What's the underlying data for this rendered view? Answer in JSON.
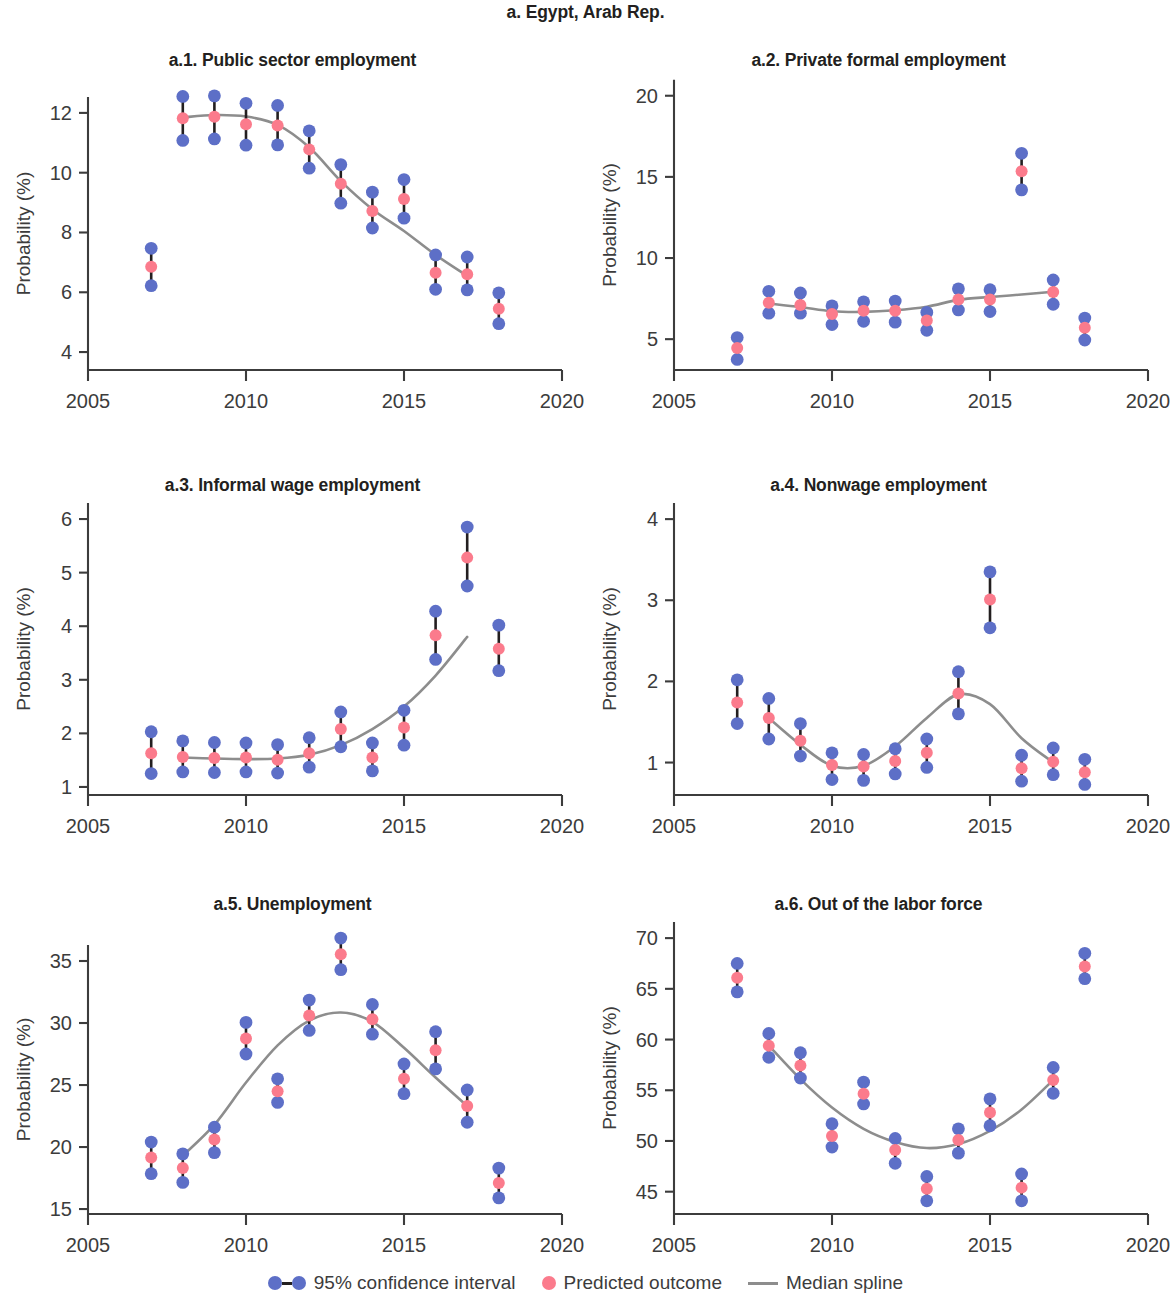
{
  "figure": {
    "title": "a. Egypt, Arab Rep.",
    "colors": {
      "ci_dot": "#5d6fc7",
      "predicted_dot": "#fb7b8c",
      "ci_bar": "#231f20",
      "spline": "#8d8d8d",
      "axis": "#3c3c3c",
      "background": "#ffffff"
    }
  },
  "legend": {
    "items": [
      {
        "label": "95% confidence interval",
        "marker": "ci-dot-bar-dot"
      },
      {
        "label": "Predicted outcome",
        "marker": "pink-dot"
      },
      {
        "label": "Median spline",
        "marker": "gray-line"
      }
    ]
  },
  "chart_data": [
    {
      "type": "scatter",
      "id": "a.1",
      "title": "a.1. Public sector employment",
      "xlabel": "",
      "ylabel": "Probability (%)",
      "xlim": [
        2005,
        2020
      ],
      "ylim": [
        3.4,
        12.9
      ],
      "xticks": [
        2005,
        2010,
        2015,
        2020
      ],
      "yticks": [
        4,
        6,
        8,
        10,
        12
      ],
      "grid": false,
      "x": [
        2007,
        2008,
        2009,
        2010,
        2011,
        2012,
        2013,
        2014,
        2015,
        2016,
        2017,
        2018
      ],
      "predicted": [
        6.85,
        11.82,
        11.87,
        11.62,
        11.58,
        10.78,
        9.63,
        8.72,
        9.12,
        6.65,
        6.6,
        5.45
      ],
      "ci_low": [
        6.22,
        11.08,
        11.13,
        10.92,
        10.93,
        10.15,
        8.98,
        8.15,
        8.48,
        6.1,
        6.08,
        4.95
      ],
      "ci_high": [
        7.47,
        12.55,
        12.57,
        12.32,
        12.25,
        11.4,
        10.27,
        9.35,
        9.77,
        7.25,
        7.18,
        5.98
      ],
      "spline": [
        [
          2008,
          11.85
        ],
        [
          2009,
          11.93
        ],
        [
          2010,
          11.88
        ],
        [
          2011,
          11.6
        ],
        [
          2012,
          10.85
        ],
        [
          2013,
          9.72
        ],
        [
          2014,
          8.78
        ],
        [
          2015,
          8.05
        ],
        [
          2016,
          7.25
        ],
        [
          2017,
          6.55
        ]
      ]
    },
    {
      "type": "scatter",
      "id": "a.2",
      "title": "a.2. Private formal employment",
      "xlabel": "",
      "ylabel": "Probability (%)",
      "xlim": [
        2005,
        2020
      ],
      "ylim": [
        3.1,
        20.6
      ],
      "xticks": [
        2005,
        2010,
        2015,
        2020
      ],
      "yticks": [
        5,
        10,
        15,
        20
      ],
      "grid": false,
      "x": [
        2007,
        2008,
        2009,
        2010,
        2011,
        2012,
        2013,
        2014,
        2015,
        2016,
        2017,
        2018
      ],
      "predicted": [
        4.45,
        7.25,
        7.1,
        6.55,
        6.75,
        6.75,
        6.15,
        7.45,
        7.45,
        15.35,
        7.9,
        5.7
      ],
      "ci_low": [
        3.75,
        6.6,
        6.6,
        5.9,
        6.1,
        6.05,
        5.55,
        6.8,
        6.7,
        14.2,
        7.15,
        4.95
      ],
      "ci_high": [
        5.1,
        7.95,
        7.85,
        7.05,
        7.3,
        7.35,
        6.65,
        8.1,
        8.05,
        16.45,
        8.65,
        6.3
      ],
      "spline": [
        [
          2008,
          7.2
        ],
        [
          2009,
          6.98
        ],
        [
          2010,
          6.72
        ],
        [
          2011,
          6.68
        ],
        [
          2012,
          6.78
        ],
        [
          2013,
          7.0
        ],
        [
          2014,
          7.42
        ],
        [
          2015,
          7.6
        ],
        [
          2016,
          7.75
        ],
        [
          2017,
          7.92
        ]
      ]
    },
    {
      "type": "scatter",
      "id": "a.3",
      "title": "a.3. Informal wage employment",
      "xlabel": "",
      "ylabel": "Probability (%)",
      "xlim": [
        2005,
        2020
      ],
      "ylim": [
        0.85,
        6.15
      ],
      "xticks": [
        2005,
        2010,
        2015,
        2020
      ],
      "yticks": [
        1,
        2,
        3,
        4,
        5,
        6
      ],
      "grid": false,
      "x": [
        2007,
        2008,
        2009,
        2010,
        2011,
        2012,
        2013,
        2014,
        2015,
        2016,
        2017,
        2018
      ],
      "predicted": [
        1.63,
        1.56,
        1.54,
        1.55,
        1.51,
        1.63,
        2.08,
        1.55,
        2.11,
        3.83,
        5.28,
        3.58
      ],
      "ci_low": [
        1.25,
        1.28,
        1.27,
        1.28,
        1.26,
        1.37,
        1.75,
        1.3,
        1.78,
        3.38,
        4.75,
        3.17
      ],
      "ci_high": [
        2.03,
        1.86,
        1.83,
        1.82,
        1.79,
        1.92,
        2.4,
        1.82,
        2.43,
        4.28,
        5.85,
        4.02
      ],
      "spline": [
        [
          2008,
          1.55
        ],
        [
          2009,
          1.53
        ],
        [
          2010,
          1.52
        ],
        [
          2011,
          1.53
        ],
        [
          2012,
          1.6
        ],
        [
          2013,
          1.78
        ],
        [
          2014,
          2.08
        ],
        [
          2015,
          2.5
        ],
        [
          2016,
          3.08
        ],
        [
          2017,
          3.8
        ]
      ]
    },
    {
      "type": "scatter",
      "id": "a.4",
      "title": "a.4. Nonwage employment",
      "xlabel": "",
      "ylabel": "Probability (%)",
      "xlim": [
        2005,
        2020
      ],
      "ylim": [
        0.6,
        4.1
      ],
      "xticks": [
        2005,
        2010,
        2015,
        2020
      ],
      "yticks": [
        1,
        2,
        3,
        4
      ],
      "grid": false,
      "x": [
        2007,
        2008,
        2009,
        2010,
        2011,
        2012,
        2013,
        2014,
        2015,
        2016,
        2017,
        2018
      ],
      "predicted": [
        1.74,
        1.55,
        1.27,
        0.97,
        0.95,
        1.02,
        1.12,
        1.85,
        3.01,
        0.93,
        1.01,
        0.88
      ],
      "ci_low": [
        1.48,
        1.29,
        1.08,
        0.79,
        0.78,
        0.86,
        0.94,
        1.6,
        2.66,
        0.77,
        0.85,
        0.73
      ],
      "ci_high": [
        2.02,
        1.79,
        1.48,
        1.12,
        1.1,
        1.17,
        1.29,
        2.12,
        3.35,
        1.09,
        1.18,
        1.04
      ],
      "spline": [
        [
          2008,
          1.55
        ],
        [
          2009,
          1.22
        ],
        [
          2010,
          0.96
        ],
        [
          2011,
          0.96
        ],
        [
          2012,
          1.2
        ],
        [
          2013,
          1.55
        ],
        [
          2014,
          1.84
        ],
        [
          2015,
          1.72
        ],
        [
          2016,
          1.3
        ],
        [
          2017,
          1.0
        ]
      ]
    },
    {
      "type": "scatter",
      "id": "a.5",
      "title": "a.5. Unemployment",
      "xlabel": "",
      "ylabel": "Probability (%)",
      "xlim": [
        2005,
        2020
      ],
      "ylim": [
        14.6,
        37.5
      ],
      "xticks": [
        2005,
        2010,
        2015,
        2020
      ],
      "yticks": [
        15,
        20,
        25,
        30,
        35
      ],
      "grid": false,
      "x": [
        2007,
        2008,
        2009,
        2010,
        2011,
        2012,
        2013,
        2014,
        2015,
        2016,
        2017,
        2018
      ],
      "predicted": [
        19.15,
        18.3,
        20.6,
        28.75,
        24.5,
        30.6,
        35.55,
        30.3,
        25.5,
        27.8,
        23.3,
        17.1
      ],
      "ci_low": [
        17.85,
        17.15,
        19.55,
        27.5,
        23.6,
        29.4,
        34.3,
        29.1,
        24.3,
        26.3,
        22.0,
        15.9
      ],
      "ci_high": [
        20.4,
        19.45,
        21.6,
        30.05,
        25.5,
        31.85,
        36.85,
        31.5,
        26.7,
        29.3,
        24.6,
        18.3
      ],
      "spline": [
        [
          2008,
          19.3
        ],
        [
          2009,
          21.8
        ],
        [
          2010,
          25.2
        ],
        [
          2011,
          28.2
        ],
        [
          2012,
          30.2
        ],
        [
          2013,
          30.85
        ],
        [
          2014,
          30.1
        ],
        [
          2015,
          28.0
        ],
        [
          2016,
          25.6
        ],
        [
          2017,
          23.3
        ]
      ]
    },
    {
      "type": "scatter",
      "id": "a.6",
      "title": "a.6. Out of the labor force",
      "xlabel": "",
      "ylabel": "Probability (%)",
      "xlim": [
        2005,
        2020
      ],
      "ylim": [
        42.8,
        70.8
      ],
      "xticks": [
        2005,
        2010,
        2015,
        2020
      ],
      "yticks": [
        45,
        50,
        55,
        60,
        65,
        70
      ],
      "grid": false,
      "x": [
        2007,
        2008,
        2009,
        2010,
        2011,
        2012,
        2013,
        2014,
        2015,
        2016,
        2017,
        2018
      ],
      "predicted": [
        66.1,
        59.4,
        57.45,
        50.5,
        54.65,
        49.1,
        45.3,
        50.1,
        52.8,
        45.4,
        56.0,
        67.2
      ],
      "ci_low": [
        64.7,
        58.25,
        56.2,
        49.4,
        53.65,
        47.8,
        44.1,
        48.8,
        51.5,
        44.1,
        54.7,
        66.0
      ],
      "ci_high": [
        67.5,
        60.6,
        58.7,
        51.7,
        55.8,
        50.25,
        46.5,
        51.2,
        54.15,
        46.75,
        57.25,
        68.5
      ],
      "spline": [
        [
          2008,
          59.4
        ],
        [
          2009,
          56.1
        ],
        [
          2010,
          53.3
        ],
        [
          2011,
          51.2
        ],
        [
          2012,
          49.9
        ],
        [
          2013,
          49.3
        ],
        [
          2014,
          49.7
        ],
        [
          2015,
          51.0
        ],
        [
          2016,
          53.1
        ],
        [
          2017,
          56.0
        ]
      ]
    }
  ]
}
